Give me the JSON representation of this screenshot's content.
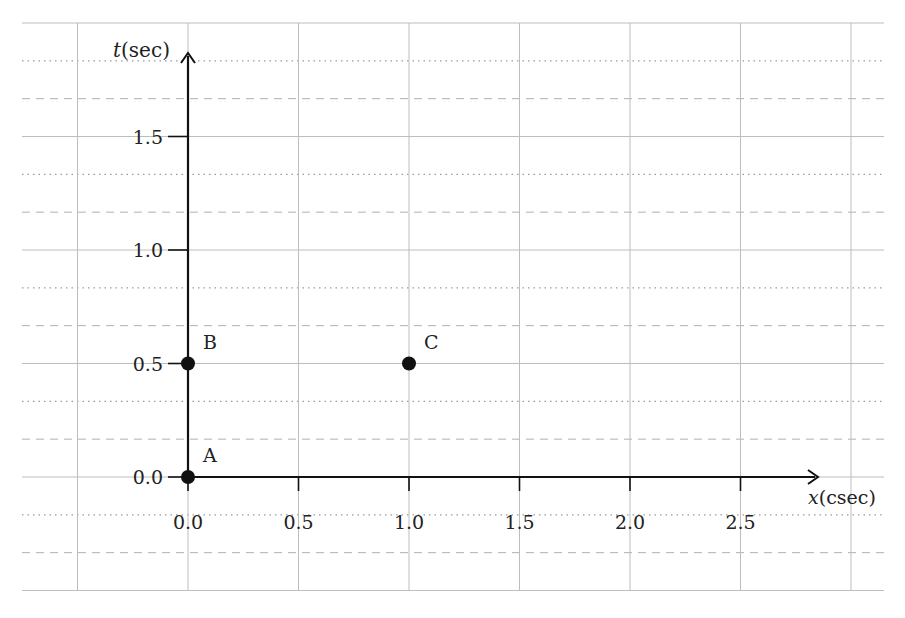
{
  "chart_data": {
    "type": "scatter",
    "title": "",
    "xlabel_var": "x",
    "xlabel_unit": "(csec)",
    "ylabel_var": "t",
    "ylabel_unit": "(sec)",
    "xlim": [
      -0.5,
      3.0
    ],
    "ylim": [
      -0.5,
      2.0
    ],
    "x_ticks": [
      "0.0",
      "0.5",
      "1.0",
      "1.5",
      "2.0",
      "2.5"
    ],
    "y_ticks": [
      "0.0",
      "0.5",
      "1.0",
      "1.5"
    ],
    "grid": true,
    "legend": null,
    "series": [
      {
        "name": "events",
        "points": [
          {
            "label": "A",
            "x": 0.0,
            "t": 0.0
          },
          {
            "label": "B",
            "x": 0.0,
            "t": 0.5
          },
          {
            "label": "C",
            "x": 1.0,
            "t": 0.5
          }
        ]
      }
    ]
  },
  "colors": {
    "axis": "#111111",
    "grid": "#bdbdbd",
    "point": "#111111"
  }
}
